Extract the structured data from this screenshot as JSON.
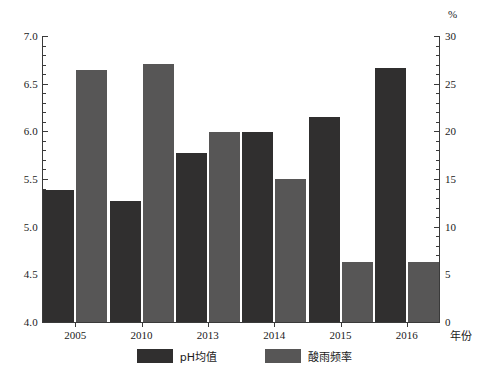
{
  "chart_data": {
    "type": "bar",
    "title": "",
    "subtitle": "",
    "categories": [
      "2005",
      "2010",
      "2013",
      "2014",
      "2015",
      "2016"
    ],
    "series": [
      {
        "name": "pH均值",
        "axis": "left",
        "color": "#302f2f",
        "values": [
          5.38,
          5.27,
          5.77,
          5.99,
          6.15,
          6.66
        ]
      },
      {
        "name": "酸雨频率",
        "axis": "right",
        "color": "#575656",
        "values": [
          26.4,
          27.1,
          19.9,
          15.0,
          6.3,
          6.3
        ]
      }
    ],
    "xlabel": "年份",
    "ylabel": "",
    "ylim": [
      4.0,
      7.0
    ],
    "y_ticks": [
      "4.0",
      "4.5",
      "5.0",
      "5.5",
      "6.0",
      "6.5",
      "7.0"
    ],
    "y_minor_step": 0.1,
    "y2label": "%",
    "y2lim": [
      0,
      30
    ],
    "y2_ticks": [
      "0",
      "5",
      "10",
      "15",
      "20",
      "25",
      "30"
    ],
    "y2_minor_step": 1,
    "grid": false,
    "legend_position": "bottom"
  },
  "legend": {
    "items": [
      {
        "label": "pH均值",
        "color": "#302f2f"
      },
      {
        "label": "酸雨频率",
        "color": "#575656"
      }
    ]
  },
  "axes": {
    "left_unit": "",
    "right_unit": "%",
    "x_axis_title": "年份"
  },
  "colors": {
    "bar_ph": "#302f2f",
    "bar_freq": "#575656",
    "axis": "#3a3a3a",
    "background": "#ffffff",
    "text": "#1a1a1a"
  }
}
